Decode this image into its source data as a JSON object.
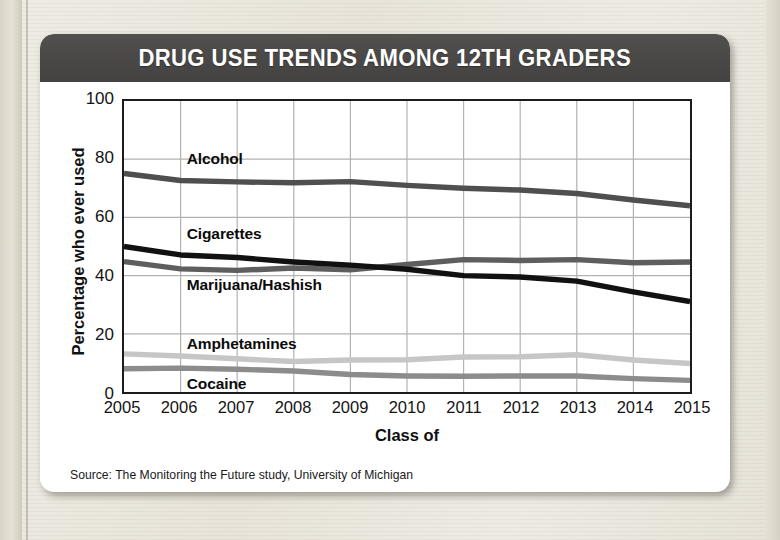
{
  "card": {
    "title": "DRUG USE TRENDS AMONG 12TH GRADERS",
    "source_note": "Source: The Monitoring the Future study, University of Michigan"
  },
  "colors": {
    "banner_bg": "#4b4947",
    "banner_text": "#ffffff",
    "card_bg": "#ffffff",
    "page_bg": "#e9e5dc",
    "axis": "#1c1c1c",
    "grid": "#b2b2b2",
    "alcohol": "#4f4f4f",
    "cigarettes": "#111111",
    "marijuana": "#5e5e5e",
    "amphetamines": "#c6c6c6",
    "cocaine": "#8c8c8c"
  },
  "chart_data": {
    "type": "line",
    "title": "DRUG USE TRENDS AMONG 12TH GRADERS",
    "xlabel": "Class of",
    "ylabel": "Percentage who ever used",
    "xlim": [
      2005,
      2015
    ],
    "ylim": [
      0,
      100
    ],
    "grid": true,
    "legend_position": "inline-labels",
    "x": [
      2005,
      2006,
      2007,
      2008,
      2009,
      2010,
      2011,
      2012,
      2013,
      2014,
      2015
    ],
    "xtick_labels": [
      "2005",
      "2006",
      "2007",
      "2008",
      "2009",
      "2010",
      "2011",
      "2012",
      "2013",
      "2014",
      "2015"
    ],
    "ytick_labels": [
      "0",
      "20",
      "40",
      "60",
      "80",
      "100"
    ],
    "ytick_values": [
      0,
      20,
      40,
      60,
      80,
      100
    ],
    "series": [
      {
        "name": "Alcohol",
        "color": "#4f4f4f",
        "width": 5.5,
        "values": [
          75.1,
          72.7,
          72.2,
          71.9,
          72.3,
          71.0,
          70.0,
          69.4,
          68.2,
          66.0,
          64.0
        ],
        "label_x": 2006.1,
        "label_y": 80.5
      },
      {
        "name": "Cigarettes",
        "color": "#111111",
        "width": 5.5,
        "values": [
          50.0,
          47.1,
          46.2,
          44.7,
          43.6,
          42.2,
          40.0,
          39.5,
          38.1,
          34.4,
          31.1
        ],
        "label_x": 2006.1,
        "label_y": 55.0
      },
      {
        "name": "Marijuana/Hashish",
        "color": "#5e5e5e",
        "width": 5.5,
        "values": [
          44.8,
          42.3,
          41.8,
          42.6,
          42.0,
          43.8,
          45.5,
          45.2,
          45.5,
          44.4,
          44.7
        ],
        "label_x": 2006.1,
        "label_y": 37.5
      },
      {
        "name": "Amphetamines",
        "color": "#c6c6c6",
        "width": 5.5,
        "values": [
          13.1,
          12.4,
          11.4,
          10.5,
          11.0,
          11.1,
          12.0,
          12.1,
          12.8,
          11.0,
          9.8
        ],
        "label_x": 2006.1,
        "label_y": 17.5
      },
      {
        "name": "Cocaine",
        "color": "#8c8c8c",
        "width": 5.5,
        "values": [
          8.0,
          8.2,
          7.8,
          7.2,
          6.0,
          5.5,
          5.4,
          5.5,
          5.5,
          4.6,
          4.0
        ],
        "label_x": 2006.1,
        "label_y": 4.0
      }
    ]
  }
}
